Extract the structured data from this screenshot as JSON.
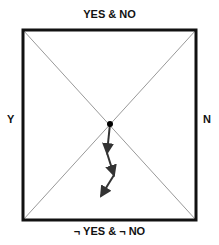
{
  "labels": {
    "top": "YES & NO",
    "bottom": "¬ YES & ¬ NO",
    "left": "Y",
    "right": "N"
  },
  "diagram": {
    "box": {
      "x": 23,
      "y": 30,
      "width": 173,
      "height": 190
    },
    "center": {
      "x": 110,
      "y": 124
    },
    "path_points": [
      [
        110,
        124
      ],
      [
        107,
        153
      ],
      [
        114,
        175
      ],
      [
        101,
        196
      ]
    ],
    "colors": {
      "box": "#111111",
      "diagonals": "#999999",
      "path": "#333333"
    }
  }
}
